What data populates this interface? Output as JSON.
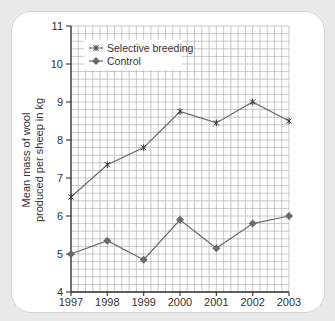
{
  "chart_data": {
    "type": "line",
    "title": "",
    "xlabel": "",
    "ylabel": [
      "Mean mass of wool",
      "produced per sheep in kg"
    ],
    "x": [
      1997,
      1998,
      1999,
      2000,
      2001,
      2002,
      2003
    ],
    "x_tick_labels": [
      "1997",
      "1998",
      "1999",
      "2000",
      "2001",
      "2002",
      "2003"
    ],
    "y_ticks": [
      4,
      5,
      6,
      7,
      8,
      9,
      10,
      11
    ],
    "y_tick_labels": [
      "4",
      "5",
      "6",
      "7",
      "8",
      "9",
      "10",
      "11"
    ],
    "ylim": [
      4,
      11
    ],
    "xlim": [
      1997,
      2003
    ],
    "grid": true,
    "grid_minor_divisions": 5,
    "legend_position": "upper-left",
    "series": [
      {
        "name": "Selective breeding",
        "marker": "star-cross",
        "values": [
          6.5,
          7.35,
          7.8,
          8.75,
          8.45,
          9.0,
          8.5
        ]
      },
      {
        "name": "Control",
        "marker": "diamond",
        "values": [
          5.0,
          5.35,
          4.85,
          5.9,
          5.15,
          5.8,
          6.0
        ]
      }
    ]
  },
  "colors": {
    "line": "#6a6a6a",
    "grid": "#b0b0b0",
    "axis": "#333333",
    "background": "#e9e9e9",
    "card": "#ffffff"
  }
}
